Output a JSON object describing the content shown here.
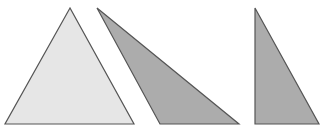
{
  "diagram": {
    "background": "#ffffff",
    "stroke_color": "#555555",
    "shapes": [
      {
        "id": "equilateral-triangle",
        "kind": "triangle",
        "fill": "#e6e6e6",
        "points": [
          [
            70,
            8
          ],
          [
            5,
            124
          ],
          [
            134,
            124
          ]
        ]
      },
      {
        "id": "obtuse-triangle",
        "kind": "triangle",
        "fill": "#acacac",
        "points": [
          [
            97,
            8
          ],
          [
            160,
            124
          ],
          [
            239,
            124
          ]
        ]
      },
      {
        "id": "right-triangle",
        "kind": "triangle",
        "fill": "#acacac",
        "points": [
          [
            255,
            8
          ],
          [
            255,
            124
          ],
          [
            319,
            124
          ]
        ]
      }
    ]
  }
}
